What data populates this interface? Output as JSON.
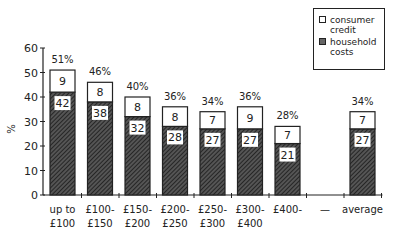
{
  "chart_data": {
    "type": "bar",
    "stacked": true,
    "title": "",
    "xlabel": "",
    "ylabel": "%",
    "ylim": [
      0,
      60
    ],
    "yticks": [
      0,
      10,
      20,
      30,
      40,
      50,
      60
    ],
    "categories": [
      "up to £100",
      "£100-£150",
      "£150-£200",
      "£200-£250",
      "£250-£300",
      "£300-£400",
      "£400-",
      "—",
      "average"
    ],
    "category_lines": [
      [
        "up to",
        "£100"
      ],
      [
        "£100-",
        "£150"
      ],
      [
        "£150-",
        "£200"
      ],
      [
        "£200-",
        "£250"
      ],
      [
        "£250-",
        "£300"
      ],
      [
        "£300-",
        "£400"
      ],
      [
        "£400-",
        ""
      ],
      [
        "—",
        ""
      ],
      [
        "average",
        ""
      ]
    ],
    "series": [
      {
        "name": "household costs",
        "pattern": "hatched",
        "values": [
          42,
          38,
          32,
          28,
          27,
          27,
          21,
          null,
          27
        ]
      },
      {
        "name": "consumer credit",
        "pattern": "white",
        "values": [
          9,
          8,
          8,
          8,
          7,
          9,
          7,
          null,
          7
        ]
      }
    ],
    "totals": [
      "51%",
      "46%",
      "40%",
      "36%",
      "34%",
      "36%",
      "28%",
      "",
      "34%"
    ],
    "legend": {
      "position": "top-right",
      "entries": [
        {
          "label_lines": [
            "consumer",
            "credit"
          ],
          "pattern": "white"
        },
        {
          "label_lines": [
            "household",
            "costs"
          ],
          "pattern": "hatched"
        }
      ]
    },
    "grid": false
  }
}
